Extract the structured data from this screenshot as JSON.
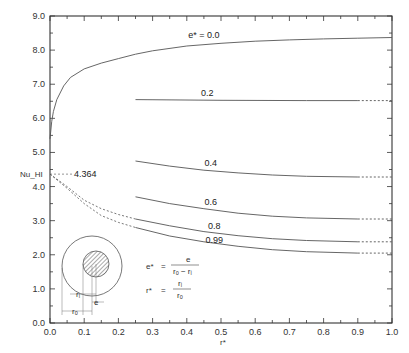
{
  "chart_data": {
    "type": "line",
    "title": "",
    "xlabel": "r*",
    "ylabel": "Nu_HI",
    "xlim": [
      0.0,
      1.0
    ],
    "ylim": [
      0.0,
      9.0
    ],
    "grid": false,
    "x_ticks": [
      "0.0",
      "0.1",
      "0.2",
      "0.3",
      "0.4",
      "0.5",
      "0.6",
      "0.7",
      "0.8",
      "0.9",
      "1.0"
    ],
    "y_ticks": [
      "0.0",
      "1.0",
      "2.0",
      "3.0",
      "4.0",
      "5.0",
      "6.0",
      "7.0",
      "8.0",
      "9.0"
    ],
    "reference_value": {
      "label": "4.364",
      "x": 0.0,
      "y": 4.364
    },
    "series": [
      {
        "name": "e* = 0.0",
        "label": "e* = 0.0",
        "label_pos": [
          0.45,
          8.35
        ],
        "points": [
          [
            0.0,
            5.4
          ],
          [
            0.005,
            5.9
          ],
          [
            0.01,
            6.2
          ],
          [
            0.02,
            6.55
          ],
          [
            0.04,
            6.95
          ],
          [
            0.06,
            7.2
          ],
          [
            0.1,
            7.45
          ],
          [
            0.15,
            7.62
          ],
          [
            0.2,
            7.75
          ],
          [
            0.25,
            7.88
          ],
          [
            0.3,
            7.98
          ],
          [
            0.4,
            8.12
          ],
          [
            0.5,
            8.2
          ],
          [
            0.6,
            8.26
          ],
          [
            0.7,
            8.3
          ],
          [
            0.8,
            8.33
          ],
          [
            0.9,
            8.35
          ],
          [
            1.0,
            8.37
          ]
        ],
        "dashed_from": null
      },
      {
        "name": "e* = 0.2",
        "label": "0.2",
        "label_pos": [
          0.46,
          6.65
        ],
        "points": [
          [
            0.25,
            6.55
          ],
          [
            0.5,
            6.53
          ],
          [
            0.75,
            6.52
          ],
          [
            0.9,
            6.52
          ],
          [
            1.0,
            6.52
          ]
        ],
        "dashed_from": 0.9
      },
      {
        "name": "e* = 0.4",
        "label": "0.4",
        "label_pos": [
          0.47,
          4.6
        ],
        "points": [
          [
            0.25,
            4.75
          ],
          [
            0.35,
            4.6
          ],
          [
            0.45,
            4.48
          ],
          [
            0.55,
            4.4
          ],
          [
            0.65,
            4.34
          ],
          [
            0.75,
            4.3
          ],
          [
            0.9,
            4.28
          ],
          [
            1.0,
            4.28
          ]
        ],
        "dashed_from": 0.9
      },
      {
        "name": "e* = 0.6",
        "label": "0.6",
        "label_pos": [
          0.47,
          3.45
        ],
        "points": [
          [
            0.25,
            3.7
          ],
          [
            0.35,
            3.5
          ],
          [
            0.45,
            3.35
          ],
          [
            0.55,
            3.22
          ],
          [
            0.65,
            3.13
          ],
          [
            0.75,
            3.08
          ],
          [
            0.9,
            3.05
          ],
          [
            1.0,
            3.05
          ]
        ],
        "dashed_from": 0.9
      },
      {
        "name": "e* = 0.8",
        "label": "0.8",
        "label_pos": [
          0.48,
          2.75
        ],
        "points": [
          [
            0.25,
            3.05
          ],
          [
            0.35,
            2.85
          ],
          [
            0.45,
            2.68
          ],
          [
            0.55,
            2.56
          ],
          [
            0.65,
            2.47
          ],
          [
            0.75,
            2.42
          ],
          [
            0.9,
            2.38
          ],
          [
            1.0,
            2.38
          ]
        ],
        "dashed_from": 0.9,
        "dashed_lead_in": [
          [
            0.0,
            4.364
          ],
          [
            0.05,
            4.0
          ],
          [
            0.1,
            3.6
          ],
          [
            0.15,
            3.35
          ],
          [
            0.2,
            3.18
          ],
          [
            0.25,
            3.05
          ]
        ]
      },
      {
        "name": "e* = 0.99",
        "label": "0.99",
        "label_pos": [
          0.48,
          2.35
        ],
        "points": [
          [
            0.25,
            2.8
          ],
          [
            0.35,
            2.55
          ],
          [
            0.45,
            2.38
          ],
          [
            0.55,
            2.25
          ],
          [
            0.65,
            2.15
          ],
          [
            0.75,
            2.09
          ],
          [
            0.9,
            2.05
          ],
          [
            1.0,
            2.05
          ]
        ],
        "dashed_from": 0.9,
        "dashed_lead_in": [
          [
            0.0,
            4.364
          ],
          [
            0.05,
            3.95
          ],
          [
            0.1,
            3.5
          ],
          [
            0.15,
            3.15
          ],
          [
            0.2,
            2.95
          ],
          [
            0.25,
            2.8
          ]
        ]
      }
    ],
    "annotations": {
      "formula_e": {
        "lhs": "e*",
        "eq": "=",
        "num": "e",
        "den": "rₒ − rᵢ"
      },
      "formula_r": {
        "lhs": "r*",
        "eq": "=",
        "num": "rᵢ",
        "den": "rₒ"
      },
      "diagram_labels": {
        "ri": "rᵢ",
        "e": "e",
        "ro": "rₒ"
      }
    }
  },
  "colors": {
    "axis": "#333333",
    "curve": "#555555",
    "text": "#222222",
    "hatch": "#666666"
  }
}
